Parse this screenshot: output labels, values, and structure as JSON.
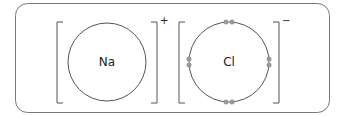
{
  "diagram": {
    "ions": [
      {
        "symbol": "Na",
        "charge": "+",
        "valence_electrons_shown": 0
      },
      {
        "symbol": "Cl",
        "charge": "−",
        "valence_electrons_shown": 8
      }
    ],
    "colors": {
      "stroke": "#555555",
      "electron": "#999999",
      "frame": "#666666"
    }
  }
}
